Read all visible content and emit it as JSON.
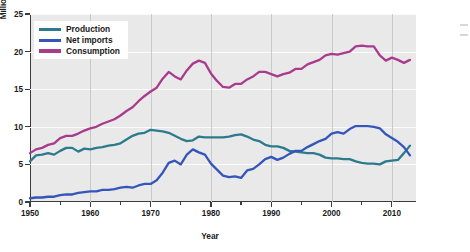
{
  "chart_data": {
    "type": "line",
    "title": "",
    "xlabel": "Year",
    "ylabel": "Million barrels per day",
    "xlim": [
      1950,
      2014
    ],
    "ylim": [
      0,
      25
    ],
    "yticks": [
      0,
      5,
      10,
      15,
      20,
      25
    ],
    "xticks": [
      1950,
      1960,
      1970,
      1980,
      1990,
      2000,
      2010
    ],
    "grid": true,
    "legend_position": "top-left",
    "x": [
      1950,
      1951,
      1952,
      1953,
      1954,
      1955,
      1956,
      1957,
      1958,
      1959,
      1960,
      1961,
      1962,
      1963,
      1964,
      1965,
      1966,
      1967,
      1968,
      1969,
      1970,
      1971,
      1972,
      1973,
      1974,
      1975,
      1976,
      1977,
      1978,
      1979,
      1980,
      1981,
      1982,
      1983,
      1984,
      1985,
      1986,
      1987,
      1988,
      1989,
      1990,
      1991,
      1992,
      1993,
      1994,
      1995,
      1996,
      1997,
      1998,
      1999,
      2000,
      2001,
      2002,
      2003,
      2004,
      2005,
      2006,
      2007,
      2008,
      2009,
      2010,
      2011,
      2012,
      2013
    ],
    "series": [
      {
        "name": "Production",
        "color": "#2c7b8d",
        "values": [
          5.4,
          6.2,
          6.3,
          6.5,
          6.3,
          6.8,
          7.2,
          7.2,
          6.7,
          7.1,
          7.0,
          7.2,
          7.3,
          7.5,
          7.6,
          7.8,
          8.3,
          8.8,
          9.1,
          9.2,
          9.6,
          9.5,
          9.4,
          9.2,
          8.8,
          8.4,
          8.1,
          8.2,
          8.7,
          8.6,
          8.6,
          8.6,
          8.6,
          8.7,
          8.9,
          9.0,
          8.7,
          8.3,
          8.1,
          7.6,
          7.4,
          7.4,
          7.2,
          6.8,
          6.7,
          6.6,
          6.5,
          6.5,
          6.3,
          5.9,
          5.8,
          5.8,
          5.7,
          5.7,
          5.4,
          5.2,
          5.1,
          5.1,
          5.0,
          5.4,
          5.5,
          5.6,
          6.5,
          7.5
        ]
      },
      {
        "name": "Net imports",
        "color": "#3456bb",
        "values": [
          0.5,
          0.6,
          0.6,
          0.7,
          0.7,
          0.9,
          1.0,
          1.0,
          1.2,
          1.3,
          1.4,
          1.4,
          1.6,
          1.6,
          1.7,
          1.9,
          2.0,
          1.9,
          2.2,
          2.4,
          2.4,
          2.9,
          3.9,
          5.2,
          5.5,
          5.0,
          6.3,
          7.0,
          6.6,
          6.3,
          5.1,
          4.3,
          3.5,
          3.3,
          3.4,
          3.2,
          4.2,
          4.4,
          5.0,
          5.7,
          6.0,
          5.6,
          5.9,
          6.4,
          6.8,
          6.8,
          7.3,
          7.7,
          8.1,
          8.4,
          9.1,
          9.3,
          9.1,
          9.7,
          10.1,
          10.1,
          10.1,
          10.0,
          9.8,
          9.0,
          8.5,
          8.0,
          7.3,
          6.2
        ]
      },
      {
        "name": "Consumption",
        "color": "#a93b8d",
        "values": [
          6.5,
          7.0,
          7.2,
          7.6,
          7.8,
          8.5,
          8.8,
          8.8,
          9.1,
          9.5,
          9.8,
          10.0,
          10.4,
          10.7,
          11.0,
          11.5,
          12.1,
          12.6,
          13.4,
          14.1,
          14.7,
          15.2,
          16.4,
          17.3,
          16.7,
          16.3,
          17.5,
          18.4,
          18.8,
          18.5,
          17.1,
          16.1,
          15.3,
          15.2,
          15.7,
          15.7,
          16.3,
          16.7,
          17.3,
          17.3,
          17.0,
          16.7,
          17.0,
          17.2,
          17.7,
          17.7,
          18.3,
          18.6,
          18.9,
          19.5,
          19.7,
          19.6,
          19.8,
          20.0,
          20.7,
          20.8,
          20.7,
          20.7,
          19.5,
          18.8,
          19.2,
          18.9,
          18.5,
          18.9
        ]
      }
    ]
  }
}
